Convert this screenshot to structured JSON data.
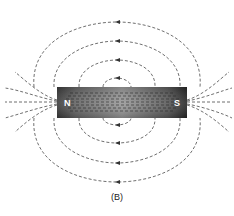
{
  "figure": {
    "caption": "(B)",
    "magnet": {
      "north_label": "N",
      "south_label": "S",
      "color_dark": "#2e2e2e",
      "color_mid": "#8a8a8a"
    },
    "field_lines": {
      "style": "dashed",
      "color": "#444444",
      "loops_above": 4,
      "loops_below": 4,
      "arrow_direction_top": "left",
      "arrow_direction_bottom": "left"
    }
  }
}
